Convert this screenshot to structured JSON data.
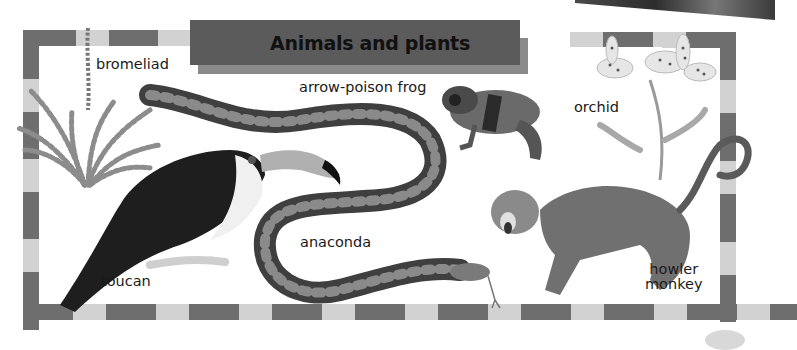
{
  "banner": {
    "title": "Animals and plants"
  },
  "labels": {
    "bromeliad": "bromeliad",
    "arrow_poison_frog": "arrow-poison frog",
    "orchid": "orchid",
    "anaconda": "anaconda",
    "toucan": "toucan",
    "howler_monkey_line1": "howler",
    "howler_monkey_line2": "monkey"
  },
  "illustrations": [
    {
      "name": "bromeliad",
      "kind": "plant"
    },
    {
      "name": "arrow-poison frog",
      "kind": "animal"
    },
    {
      "name": "orchid",
      "kind": "plant"
    },
    {
      "name": "anaconda",
      "kind": "animal"
    },
    {
      "name": "toucan",
      "kind": "animal"
    },
    {
      "name": "howler monkey",
      "kind": "animal"
    }
  ],
  "colors": {
    "frame_dark": "#6e6e6e",
    "frame_light": "#d2d2d2",
    "banner": "#5b5b5b",
    "banner_shadow": "#8a8a8a",
    "background": "#ffffff"
  }
}
